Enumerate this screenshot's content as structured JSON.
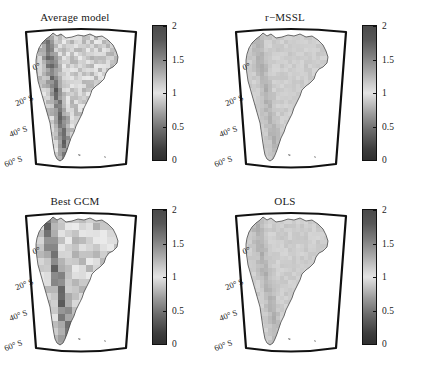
{
  "figure": {
    "background_color": "#ffffff",
    "text_color": "#1a1a1a",
    "frame_color": "#111111"
  },
  "chart_data": {
    "type": "heatmap",
    "title": "",
    "layout": {
      "rows": 2,
      "cols": 2,
      "projection": "conic",
      "region": "South America"
    },
    "shared_colorbar": {
      "min": 0,
      "max": 2,
      "ticks": [
        0,
        0.5,
        1,
        1.5,
        2
      ],
      "tick_labels": [
        "0",
        "0.5",
        "1",
        "1.5",
        "2"
      ],
      "orientation": "vertical",
      "colormap": "grayscale-diverging-dark-light-dark",
      "color_low": "#2f2f2f",
      "color_mid": "#e3e3e3",
      "color_high": "#4a4a4a"
    },
    "axes": {
      "ylabel": "",
      "xlabel": "",
      "lat_ticks": [
        0,
        -20,
        -40,
        -60
      ],
      "lat_tick_labels": [
        "0°",
        "20° S",
        "40° S",
        "60° S"
      ]
    },
    "panels": [
      {
        "id": "average-model",
        "title": "Average model",
        "position": "top-left",
        "texture": "moderate-contrast",
        "mean_value": 1.1
      },
      {
        "id": "r-mssl",
        "title": "r−MSSL",
        "position": "top-right",
        "texture": "smooth-uniform",
        "mean_value": 1.0
      },
      {
        "id": "best-gcm",
        "title": "Best GCM",
        "position": "bottom-left",
        "texture": "coarse-blocky",
        "mean_value": 1.15
      },
      {
        "id": "ols",
        "title": "OLS",
        "position": "bottom-right",
        "texture": "smooth-uniform",
        "mean_value": 1.0
      }
    ]
  },
  "panels": [
    {
      "title": "Average model",
      "lat_labels": [
        "0°",
        "20° S",
        "40° S",
        "60° S"
      ],
      "colorbar_labels": [
        "2",
        "1.5",
        "1",
        "0.5",
        "0"
      ]
    },
    {
      "title": "r−MSSL",
      "lat_labels": [
        "0°",
        "20° S",
        "40° S",
        "60° S"
      ],
      "colorbar_labels": [
        "2",
        "1.5",
        "1",
        "0.5",
        "0"
      ]
    },
    {
      "title": "Best GCM",
      "lat_labels": [
        "0°",
        "20° S",
        "40° S",
        "60° S"
      ],
      "colorbar_labels": [
        "2",
        "1.5",
        "1",
        "0.5",
        "0"
      ]
    },
    {
      "title": "OLS",
      "lat_labels": [
        "0°",
        "20° S",
        "40° S",
        "60° S"
      ],
      "colorbar_labels": [
        "2",
        "1.5",
        "1",
        "0.5",
        "0"
      ]
    }
  ]
}
